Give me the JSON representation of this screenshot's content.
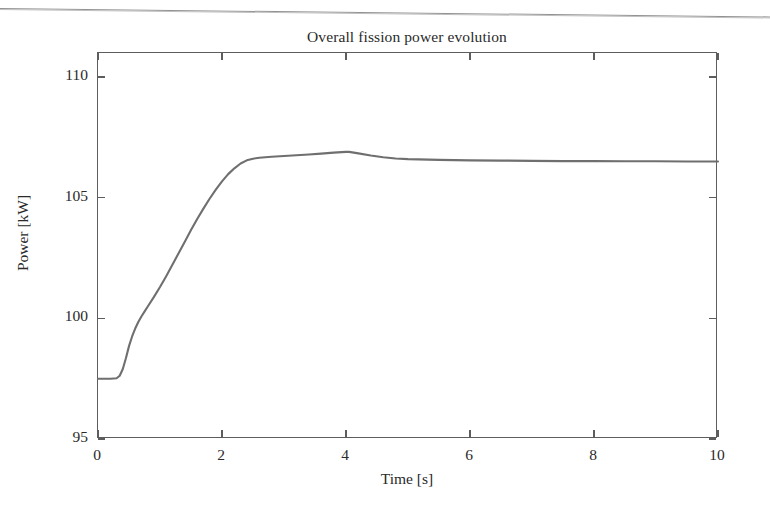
{
  "figure": {
    "title": "Overall fission power evolution",
    "background": "#ffffff",
    "frame_color": "#5d5d5d",
    "curve_color": "#6f6f6f"
  },
  "axes": {
    "x_title": "Time [s]",
    "y_title": "Power [kW]",
    "x_ticklabels": [
      "0",
      "2",
      "4",
      "6",
      "8",
      "10"
    ],
    "y_ticklabels": [
      "95",
      "100",
      "105",
      "110"
    ]
  },
  "chart_data": {
    "type": "line",
    "title": "Overall fission power evolution",
    "xlabel": "Time [s]",
    "ylabel": "Power [kW]",
    "xlim": [
      0,
      10
    ],
    "ylim": [
      95,
      111
    ],
    "xticks": [
      0,
      2,
      4,
      6,
      8,
      10
    ],
    "yticks": [
      95,
      100,
      105,
      110
    ],
    "grid": false,
    "legend": null,
    "series": [
      {
        "name": "Overall fission power",
        "color": "#6f6f6f",
        "x": [
          0.0,
          0.1,
          0.2,
          0.3,
          0.35,
          0.4,
          0.45,
          0.5,
          0.55,
          0.6,
          0.65,
          0.7,
          0.75,
          0.8,
          0.9,
          1.0,
          1.1,
          1.2,
          1.3,
          1.4,
          1.5,
          1.6,
          1.7,
          1.8,
          1.9,
          2.0,
          2.1,
          2.2,
          2.3,
          2.4,
          2.5,
          2.6,
          2.8,
          3.0,
          3.2,
          3.4,
          3.6,
          3.8,
          4.0,
          4.05,
          4.2,
          4.4,
          4.6,
          4.8,
          5.0,
          5.5,
          6.0,
          6.5,
          7.0,
          7.5,
          8.0,
          8.5,
          9.0,
          9.5,
          10.0
        ],
        "y": [
          97.5,
          97.5,
          97.5,
          97.52,
          97.62,
          97.9,
          98.35,
          98.85,
          99.25,
          99.58,
          99.85,
          100.08,
          100.28,
          100.48,
          100.88,
          101.3,
          101.75,
          102.22,
          102.7,
          103.18,
          103.66,
          104.12,
          104.55,
          104.96,
          105.34,
          105.68,
          105.98,
          106.22,
          106.42,
          106.55,
          106.62,
          106.66,
          106.7,
          106.73,
          106.76,
          106.79,
          106.83,
          106.87,
          106.9,
          106.9,
          106.84,
          106.75,
          106.68,
          106.63,
          106.6,
          106.57,
          106.55,
          106.54,
          106.53,
          106.52,
          106.52,
          106.51,
          106.51,
          106.5,
          106.5
        ]
      }
    ],
    "annotations": {
      "initial_power": 97.5,
      "knee_power": 100.3,
      "peak_power": 106.9,
      "peak_time": 4.05,
      "final_power": 106.5
    }
  }
}
